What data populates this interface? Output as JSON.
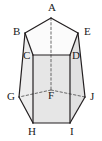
{
  "figure": {
    "name": "pentagonal-prism",
    "background_color": "#ffffff",
    "stroke_color": "#231f20",
    "hidden_stroke_color": "#5a5a5a",
    "colors": {
      "top_face": "#fbfbfb",
      "front_left_face": "#ededed",
      "front_center_face": "#e6e6e6",
      "front_right_face": "#e1e1e1",
      "bottom_band": "#dcdcdc",
      "label_color": "#1a1a1a"
    },
    "stroke_width": 1.2,
    "hidden_stroke_width": 0.9,
    "hidden_dash_pattern": "2.4 2.2"
  },
  "vertices": [
    {
      "id": "A",
      "label": "A",
      "x": 51.0,
      "y": 18.0,
      "hidden": false,
      "label_x": 48.0,
      "label_y": 2.0
    },
    {
      "id": "B",
      "label": "B",
      "x": 25.0,
      "y": 33.0,
      "hidden": false,
      "label_x": 13.0,
      "label_y": 26.0
    },
    {
      "id": "E",
      "label": "E",
      "x": 78.0,
      "y": 33.0,
      "hidden": false,
      "label_x": 84.0,
      "label_y": 26.0
    },
    {
      "id": "C",
      "label": "C",
      "x": 33.0,
      "y": 55.0,
      "hidden": false,
      "label_x": 23.0,
      "label_y": 50.0
    },
    {
      "id": "D",
      "label": "D",
      "x": 70.0,
      "y": 55.0,
      "hidden": false,
      "label_x": 72.0,
      "label_y": 50.0
    },
    {
      "id": "F",
      "label": "F",
      "x": 51.0,
      "y": 90.0,
      "hidden": true,
      "label_x": 48.0,
      "label_y": 90.0
    },
    {
      "id": "G",
      "label": "G",
      "x": 19.0,
      "y": 97.0,
      "hidden": false,
      "label_x": 7.0,
      "label_y": 91.0
    },
    {
      "id": "J",
      "label": "J",
      "x": 85.0,
      "y": 97.0,
      "hidden": false,
      "label_x": 90.0,
      "label_y": 91.0
    },
    {
      "id": "H",
      "label": "H",
      "x": 33.0,
      "y": 123.0,
      "hidden": false,
      "label_x": 28.0,
      "label_y": 126.0
    },
    {
      "id": "I",
      "label": "I",
      "x": 70.0,
      "y": 123.0,
      "hidden": false,
      "label_x": 70.0,
      "label_y": 126.0
    }
  ],
  "faces": [
    {
      "name": "top-face",
      "points": "51,18 25,33 33,55 70,55 78,33",
      "fill": "#fbfbfb"
    },
    {
      "name": "left-side-face",
      "points": "25,33 19,97 33,123 33,55",
      "fill": "#ededed"
    },
    {
      "name": "front-center-face",
      "points": "33,55 33,123 70,123 70,55",
      "fill": "#e6e6e6"
    },
    {
      "name": "right-side-face",
      "points": "78,33 70,55 70,123 85,97",
      "fill": "#e1e1e1"
    }
  ],
  "edges": [
    {
      "name": "edge-A-B",
      "from": "A",
      "to": "B",
      "hidden": false
    },
    {
      "name": "edge-A-E",
      "from": "A",
      "to": "E",
      "hidden": false
    },
    {
      "name": "edge-B-C",
      "from": "B",
      "to": "C",
      "hidden": false
    },
    {
      "name": "edge-E-D",
      "from": "E",
      "to": "D",
      "hidden": false
    },
    {
      "name": "edge-C-D",
      "from": "C",
      "to": "D",
      "hidden": false
    },
    {
      "name": "edge-B-G",
      "from": "B",
      "to": "G",
      "hidden": false
    },
    {
      "name": "edge-E-J",
      "from": "E",
      "to": "J",
      "hidden": false
    },
    {
      "name": "edge-C-H",
      "from": "C",
      "to": "H",
      "hidden": false
    },
    {
      "name": "edge-D-I",
      "from": "D",
      "to": "I",
      "hidden": false
    },
    {
      "name": "edge-G-H",
      "from": "G",
      "to": "H",
      "hidden": false
    },
    {
      "name": "edge-J-I",
      "from": "J",
      "to": "I",
      "hidden": false
    },
    {
      "name": "edge-H-I",
      "from": "H",
      "to": "I",
      "hidden": false
    },
    {
      "name": "edge-A-F-axis",
      "from": "A",
      "to": "F",
      "hidden": true
    },
    {
      "name": "edge-F-G",
      "from": "F",
      "to": "G",
      "hidden": true
    },
    {
      "name": "edge-F-J",
      "from": "F",
      "to": "J",
      "hidden": true
    }
  ]
}
